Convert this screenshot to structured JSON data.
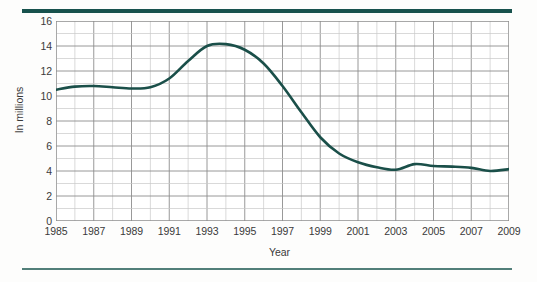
{
  "chart_data": {
    "type": "line",
    "title": "",
    "xlabel": "Year",
    "ylabel": "In millions",
    "xlim": [
      1985,
      2009
    ],
    "ylim": [
      0,
      16
    ],
    "grid": true,
    "legend": "none",
    "line_color": "#1a4f49",
    "grid_color_major": "#8d8d8d",
    "grid_color_minor": "#c9c9c9",
    "y_ticks": [
      16,
      14,
      12,
      10,
      8,
      6,
      4,
      2,
      0
    ],
    "y_minor_step": 1,
    "x_ticks": [
      1985,
      1987,
      1989,
      1991,
      1993,
      1995,
      1997,
      1999,
      2001,
      2003,
      2005,
      2007,
      2009
    ],
    "x_minor_step": 1,
    "x": [
      1985,
      1986,
      1987,
      1988,
      1989,
      1990,
      1991,
      1992,
      1993,
      1994,
      1995,
      1996,
      1997,
      1998,
      1999,
      2000,
      2001,
      2002,
      2003,
      2004,
      2005,
      2006,
      2007,
      2008,
      2009
    ],
    "values": [
      10.5,
      10.75,
      10.8,
      10.7,
      10.6,
      10.7,
      11.4,
      12.8,
      14.0,
      14.15,
      13.7,
      12.6,
      10.8,
      8.7,
      6.7,
      5.4,
      4.7,
      4.3,
      4.1,
      4.55,
      4.4,
      4.35,
      4.25,
      4.0,
      4.15
    ]
  },
  "axis": {
    "y_title": "In millions",
    "x_title": "Year"
  }
}
